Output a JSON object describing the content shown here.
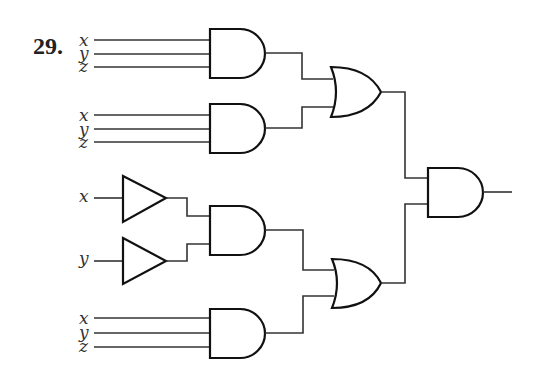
{
  "problem_number": "29.",
  "diagram": {
    "type": "logic-circuit",
    "groups": [
      {
        "id": "and1",
        "inputs": [
          "x",
          "y",
          "z"
        ],
        "gate": "AND"
      },
      {
        "id": "and2",
        "inputs": [
          "x",
          "y",
          "z"
        ],
        "gate": "AND"
      },
      {
        "id": "and3",
        "inputs": [
          "x",
          "y"
        ],
        "input_gates": [
          "buffer",
          "buffer"
        ],
        "gate": "AND"
      },
      {
        "id": "and4",
        "inputs": [
          "x",
          "y",
          "z"
        ],
        "gate": "AND"
      }
    ],
    "or_gates": [
      {
        "id": "or1",
        "inputs": [
          "and1",
          "and2"
        ]
      },
      {
        "id": "or2",
        "inputs": [
          "and3",
          "and4"
        ]
      }
    ],
    "output_gate": {
      "id": "and_final",
      "gate": "AND",
      "inputs": [
        "or1",
        "or2"
      ]
    }
  },
  "labels": {
    "g1": [
      "x",
      "y",
      "z"
    ],
    "g2": [
      "x",
      "y",
      "z"
    ],
    "g3": [
      "x",
      "y"
    ],
    "g4": [
      "x",
      "y",
      "z"
    ]
  }
}
